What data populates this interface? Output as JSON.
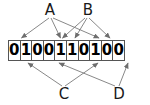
{
  "figure": {
    "background_color": "#ffffff",
    "line_color": "#777777",
    "cell_border_color": "#555555",
    "text_color": "#1a1a1a"
  },
  "bit_string": {
    "value": "0100110100",
    "length": 10,
    "bits": [
      "0",
      "1",
      "0",
      "0",
      "1",
      "1",
      "0",
      "1",
      "0",
      "0"
    ]
  },
  "top_labels": [
    {
      "id": "A",
      "text": "A"
    },
    {
      "id": "B",
      "text": "B"
    }
  ],
  "bottom_labels": [
    {
      "id": "C",
      "text": "C"
    },
    {
      "id": "D",
      "text": "D"
    }
  ],
  "connections": [
    {
      "from": "A",
      "to_index": 1
    },
    {
      "from": "A",
      "to_index": 4
    },
    {
      "from": "A",
      "to_index": 7
    },
    {
      "from": "B",
      "to_index": 4
    },
    {
      "from": "B",
      "to_index": 5
    },
    {
      "from": "B",
      "to_index": 8
    },
    {
      "from": "C",
      "to_index": 1
    },
    {
      "from": "C",
      "to_index": 7
    },
    {
      "from": "D",
      "to_index": 4
    },
    {
      "from": "D",
      "to_index": 9
    }
  ]
}
